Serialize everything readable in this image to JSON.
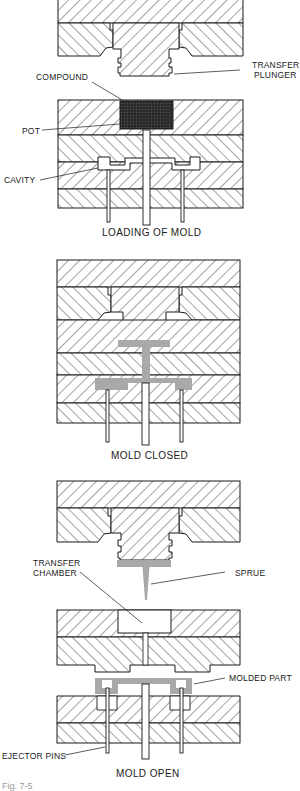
{
  "diagram": {
    "colors": {
      "line": "#1a1a1a",
      "hatch": "#333333",
      "compound": "#222222",
      "molded_material": "#a9a9a9",
      "background": "#ffffff"
    },
    "stages": [
      {
        "caption": "LOADING OF MOLD",
        "labels": {
          "compound": "COMPOUND",
          "transfer_plunger": "TRANSFER\nPLUNGER",
          "transfer_plunger_line1": "TRANSFER",
          "transfer_plunger_line2": "PLUNGER",
          "pot": "POT",
          "cavity": "CAVITY"
        }
      },
      {
        "caption": "MOLD CLOSED",
        "labels": {}
      },
      {
        "caption": "MOLD OPEN",
        "labels": {
          "transfer_chamber_line1": "TRANSFER",
          "transfer_chamber_line2": "CHAMBER",
          "sprue": "SPRUE",
          "molded_part": "MOLDED PART",
          "ejector_pins": "EJECTOR PINS"
        }
      }
    ],
    "figure_caption": "Fig. 7-5"
  }
}
